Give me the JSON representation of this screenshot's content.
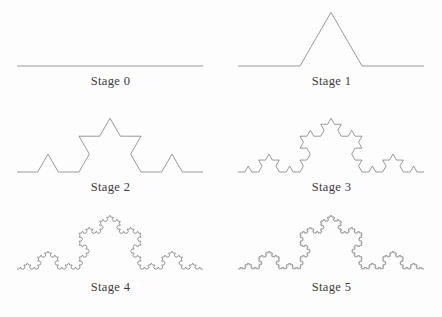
{
  "figure": {
    "name": "koch-curve-stages",
    "background_color": "#fdfdfd",
    "line_color": "#808080",
    "label_color": "#3b3b3b",
    "width": 442,
    "height": 317
  },
  "chart_data": {
    "type": "line",
    "title": "",
    "subtitle": "",
    "xlabel": "",
    "ylabel": "",
    "grid": false,
    "legend_position": "none",
    "curve_family": "koch-curve",
    "generator_rule": "Each straight segment is replaced by four segments of one third the length, with the middle pair forming an outward equilateral bump.",
    "segment_counts": [
      1,
      4,
      16,
      64,
      256,
      1024
    ],
    "baseline_span_px": 186,
    "apex_height_px": 53.69,
    "panels": [
      {
        "id": "stage-0",
        "label": "Stage 0",
        "iteration": 0,
        "segments": 1,
        "column": 0,
        "row": 0
      },
      {
        "id": "stage-1",
        "label": "Stage 1",
        "iteration": 1,
        "segments": 4,
        "column": 1,
        "row": 0
      },
      {
        "id": "stage-2",
        "label": "Stage 2",
        "iteration": 2,
        "segments": 16,
        "column": 0,
        "row": 1
      },
      {
        "id": "stage-3",
        "label": "Stage 3",
        "iteration": 3,
        "segments": 64,
        "column": 1,
        "row": 1
      },
      {
        "id": "stage-4",
        "label": "Stage 4",
        "iteration": 4,
        "segments": 256,
        "column": 0,
        "row": 2
      },
      {
        "id": "stage-5",
        "label": "Stage 5",
        "iteration": 5,
        "segments": 1024,
        "column": 1,
        "row": 2
      }
    ]
  },
  "layout": {
    "panel_width": 221,
    "panel_height_top": 106,
    "panel_height_bottom": 112,
    "curve_left_px": 17,
    "curve_right_px": 203,
    "baseline_offset_top": 66,
    "baseline_offset_bottom": 57,
    "label_offset_top": 74,
    "label_offset_bottom": 68
  }
}
